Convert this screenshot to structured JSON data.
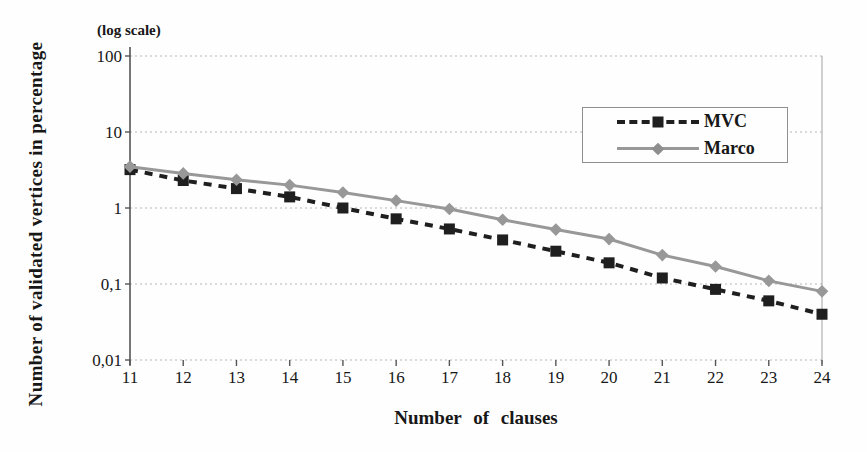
{
  "chart_data": {
    "type": "line",
    "title": "",
    "scale_note": "(log scale)",
    "xlabel": "Number of clauses",
    "ylabel": "Number of validated vertices in percentage",
    "x_categories": [
      11,
      12,
      13,
      14,
      15,
      16,
      17,
      18,
      19,
      20,
      21,
      22,
      23,
      24
    ],
    "y_axis": {
      "scale": "log",
      "range": [
        0.01,
        100
      ],
      "ticks": [
        100,
        10,
        1,
        0.1,
        0.01
      ],
      "tick_labels": [
        "100",
        "10",
        "1",
        "0,1",
        "0,01"
      ]
    },
    "grid": "horizontal-dotted",
    "legend": {
      "position": "inside-upper-right",
      "border": true
    },
    "series": [
      {
        "name": "MVC",
        "color": "#1f1f1f",
        "line_style": "dashed",
        "marker": "square",
        "values": [
          3.2,
          2.3,
          1.8,
          1.4,
          1.0,
          0.72,
          0.53,
          0.38,
          0.27,
          0.19,
          0.12,
          0.085,
          0.06,
          0.04
        ]
      },
      {
        "name": "Marco",
        "color": "#989898",
        "line_style": "solid",
        "marker": "diamond",
        "values": [
          3.5,
          2.85,
          2.35,
          2.0,
          1.6,
          1.25,
          0.97,
          0.7,
          0.52,
          0.39,
          0.24,
          0.17,
          0.11,
          0.08
        ]
      }
    ],
    "colors": {
      "grid": "#b5b5b5",
      "axis": "#555555",
      "right_border": "#b0b0b0",
      "text": "#171717"
    }
  }
}
